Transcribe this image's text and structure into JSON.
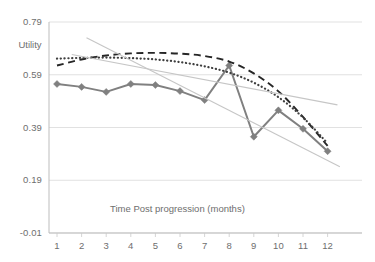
{
  "chart_data": {
    "type": "line",
    "title": "",
    "xlabel": "Time Post progression (months)",
    "ylabel": "Utility",
    "x": [
      1,
      2,
      3,
      4,
      5,
      6,
      7,
      8,
      9,
      10,
      11,
      12
    ],
    "xticklabels": [
      "1",
      "2",
      "3",
      "4",
      "5",
      "6",
      "7",
      "8",
      "9",
      "10",
      "11",
      "12"
    ],
    "yticklabels": [
      "0.79",
      "0.59",
      "0.39",
      "0.19",
      "-0.01"
    ],
    "yticks": [
      0.79,
      0.59,
      0.39,
      0.19,
      -0.01
    ],
    "ylim": [
      -0.01,
      0.79
    ],
    "xlim": [
      0.5,
      12.5
    ],
    "grid": "horizontal",
    "legend": "none",
    "series": [
      {
        "name": "observed-utility",
        "style": "solid-with-diamond-markers",
        "color": "#808080",
        "marker": "diamond",
        "values": [
          0.555,
          0.544,
          0.525,
          0.555,
          0.551,
          0.528,
          0.494,
          0.625,
          0.355,
          0.455,
          0.385,
          0.3
        ]
      },
      {
        "name": "dashed-fit",
        "style": "dashed",
        "color": "#262626",
        "marker": "none",
        "values": [
          0.625,
          0.648,
          0.663,
          0.671,
          0.673,
          0.67,
          0.661,
          0.64,
          0.595,
          0.527,
          0.43,
          0.32
        ]
      },
      {
        "name": "dotted-fit",
        "style": "dotted",
        "color": "#3f3f3f",
        "marker": "none",
        "values": [
          0.651,
          0.654,
          0.655,
          0.653,
          0.648,
          0.638,
          0.622,
          0.598,
          0.56,
          0.505,
          0.428,
          0.33
        ]
      },
      {
        "name": "linear-trend-steep",
        "style": "solid-thin-light",
        "color": "#c6c6c6",
        "marker": "none",
        "x_start": 2.2,
        "x_end": 12.5,
        "values": [
          null,
          0.74,
          0.693,
          0.645,
          0.597,
          0.549,
          0.501,
          0.453,
          0.405,
          0.357,
          0.309,
          0.265
        ]
      },
      {
        "name": "linear-trend-shallow",
        "style": "solid-thin-light",
        "color": "#c6c6c6",
        "marker": "none",
        "x_start": 1.6,
        "x_end": 12.4,
        "values": [
          null,
          0.66,
          0.643,
          0.625,
          0.607,
          0.589,
          0.571,
          0.553,
          0.535,
          0.517,
          0.499,
          0.483
        ]
      }
    ]
  }
}
